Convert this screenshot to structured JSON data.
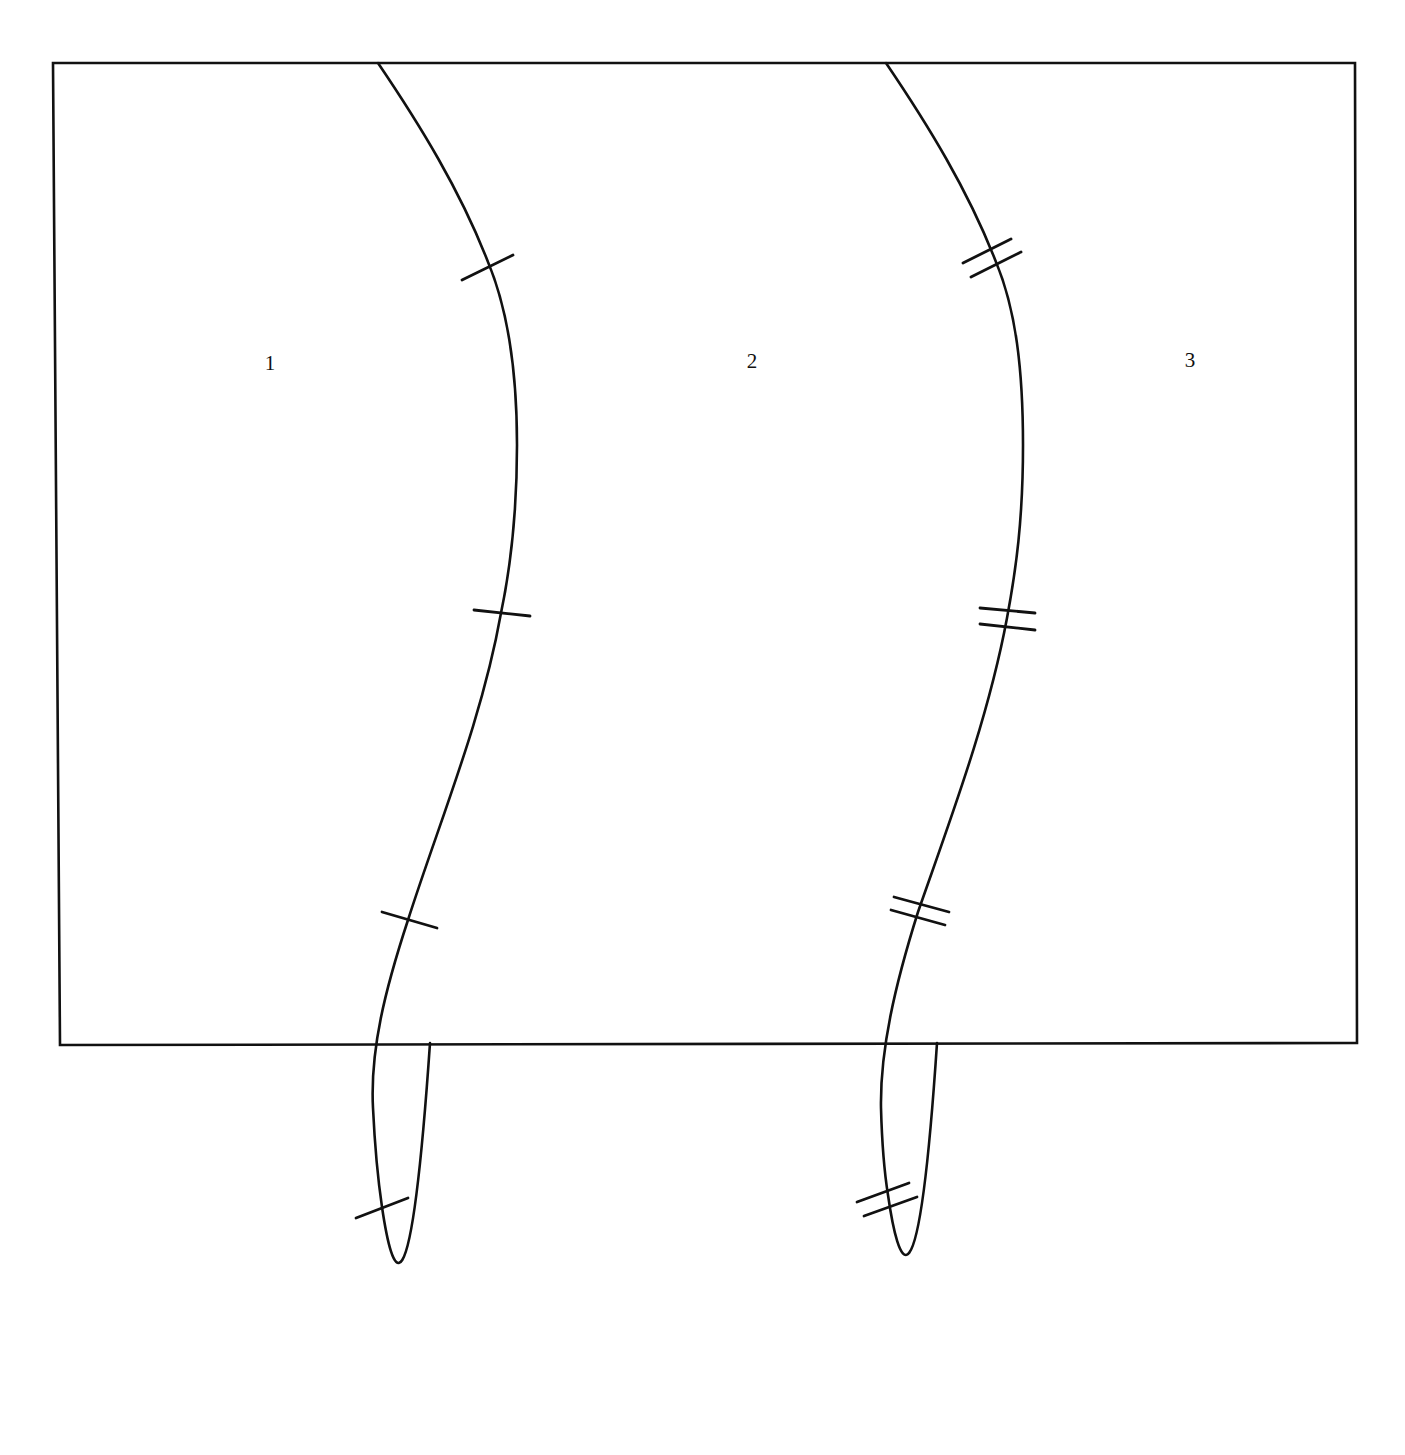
{
  "diagram": {
    "regions": [
      {
        "label": "1",
        "x": 270,
        "y": 370
      },
      {
        "label": "2",
        "x": 752,
        "y": 368
      },
      {
        "label": "3",
        "x": 1190,
        "y": 367
      }
    ],
    "curves": [
      {
        "name": "left-curve",
        "tick_style": "single",
        "tick_count": 4
      },
      {
        "name": "right-curve",
        "tick_style": "double",
        "tick_count": 4
      }
    ],
    "colors": {
      "stroke": "#111111",
      "background": "#ffffff"
    }
  }
}
